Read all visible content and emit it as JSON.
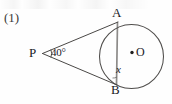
{
  "document": {
    "kind": "textbook-geometry-figure",
    "item_number": "(1)"
  },
  "figure": {
    "labels": {
      "external_point": "P",
      "tangent_point_top": "A",
      "tangent_point_bottom": "B",
      "center": "O",
      "unknown_angle": "x",
      "vertex_angle": "40°"
    },
    "geometry": {
      "circle": {
        "cx": 131.5,
        "cy": 56.5,
        "r": 32
      },
      "center_dot": {
        "cx": 132,
        "cy": 52.5,
        "r": 1.6
      },
      "point_P": {
        "x": 42,
        "y": 53
      },
      "point_A": {
        "x": 117.5,
        "y": 22.5
      },
      "point_B": {
        "x": 116.5,
        "y": 84.5
      },
      "angle_arc": {
        "cx": 42,
        "cy": 53,
        "r": 9,
        "start_deg": -22,
        "end_deg": 22
      }
    },
    "colors": {
      "ink": "#20201f",
      "line": "#53514f",
      "chord": "#8d8b89",
      "paper": "#fefefe"
    },
    "strokes": {
      "circle_width": 1.0,
      "tangent_width": 1.0,
      "chord_width": 1.6,
      "arc_width": 0.9
    }
  }
}
